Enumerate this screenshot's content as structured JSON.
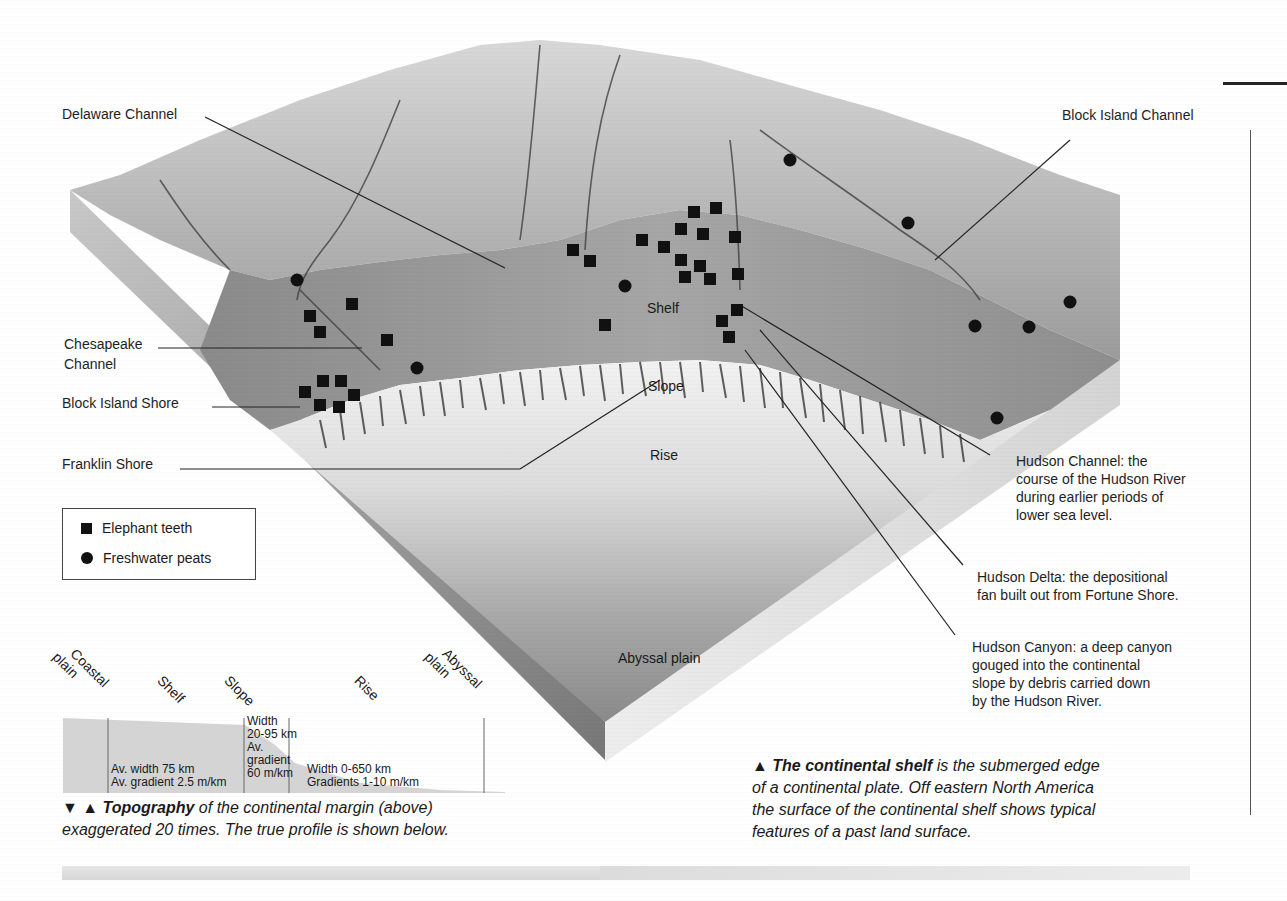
{
  "diagram": {
    "title": "The continental shelf",
    "callouts_left": [
      {
        "id": "delaware",
        "label": "Delaware Channel"
      },
      {
        "id": "chesapeake",
        "label": "Chesapeake\nChannel",
        "line1": "Chesapeake",
        "line2": "Channel"
      },
      {
        "id": "block-island-shore",
        "label": "Block Island Shore"
      },
      {
        "id": "franklin-shore",
        "label": "Franklin Shore"
      }
    ],
    "callouts_right": [
      {
        "id": "block-island-channel",
        "label": "Block Island Channel"
      },
      {
        "id": "hudson-channel",
        "lines": [
          "Hudson Channel: the",
          "course of the Hudson River",
          "during earlier periods of",
          "lower sea level."
        ]
      },
      {
        "id": "hudson-delta",
        "lines": [
          "Hudson Delta: the depositional",
          "fan built out from Fortune Shore."
        ]
      },
      {
        "id": "hudson-canyon",
        "lines": [
          "Hudson Canyon: a deep canyon",
          "gouged into the continental",
          "slope by debris carried down",
          "by the Hudson River."
        ]
      }
    ],
    "zone_labels": {
      "shelf": "Shelf",
      "slope": "Slope",
      "rise": "Rise",
      "abyssal": "Abyssal plain"
    }
  },
  "legend": {
    "items": [
      {
        "symbol": "square",
        "label": "Elephant teeth"
      },
      {
        "symbol": "circle",
        "label": "Freshwater peats"
      }
    ]
  },
  "profile": {
    "headings": [
      "Coastal plain",
      "Shelf",
      "Slope",
      "Rise",
      "Abyssal plain"
    ],
    "heading_lines": [
      [
        "Coastal",
        "plain"
      ],
      [
        "Shelf"
      ],
      [
        "Slope"
      ],
      [
        "Rise"
      ],
      [
        "Abyssal",
        "plain"
      ]
    ],
    "shelf_text": [
      "Av. width 75 km",
      "Av. gradient 2.5 m/km"
    ],
    "slope_text": [
      "Width",
      "20-95 km",
      "Av.",
      "gradient",
      "60 m/km"
    ],
    "rise_text": [
      "Width 0-650 km",
      "Gradients 1-10 m/km"
    ]
  },
  "captions": {
    "topography": {
      "markers": "▼ ▲",
      "bold": "Topography",
      "rest_line1": " of the continental margin (above)",
      "line2": "exaggerated 20 times. The true profile is shown below."
    },
    "shelf": {
      "marker": "▲",
      "bold": "The continental shelf",
      "rest_line1": " is the submerged edge",
      "line2": "of a continental plate. Off eastern North America",
      "line3": "the surface of the continental shelf shows typical",
      "line4": "features of a past land surface."
    }
  },
  "markers": {
    "elephant_teeth": [
      [
        352,
        304
      ],
      [
        310,
        316
      ],
      [
        320,
        332
      ],
      [
        387,
        340
      ],
      [
        305,
        392
      ],
      [
        323,
        381
      ],
      [
        341,
        381
      ],
      [
        354,
        395
      ],
      [
        320,
        405
      ],
      [
        339,
        407
      ],
      [
        573,
        250
      ],
      [
        590,
        261
      ],
      [
        605,
        325
      ],
      [
        642,
        240
      ],
      [
        664,
        247
      ],
      [
        694,
        212
      ],
      [
        716,
        208
      ],
      [
        681,
        229
      ],
      [
        703,
        234
      ],
      [
        735,
        237
      ],
      [
        681,
        260
      ],
      [
        700,
        266
      ],
      [
        685,
        277
      ],
      [
        710,
        279
      ],
      [
        738,
        274
      ],
      [
        737,
        310
      ],
      [
        722,
        321
      ],
      [
        729,
        337
      ]
    ],
    "freshwater_peats": [
      [
        297,
        280
      ],
      [
        417,
        368
      ],
      [
        625,
        286
      ],
      [
        790,
        160
      ],
      [
        908,
        223
      ],
      [
        975,
        326
      ],
      [
        1029,
        327
      ],
      [
        1070,
        302
      ],
      [
        997,
        418
      ]
    ]
  }
}
